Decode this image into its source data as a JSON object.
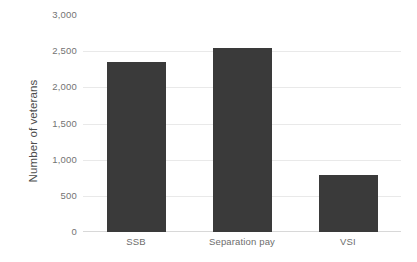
{
  "chart_data": {
    "type": "bar",
    "title": "",
    "subtitle": "",
    "xlabel": "",
    "ylabel": "Number of veterans",
    "categories": [
      "SSB",
      "Separation pay",
      "VSI"
    ],
    "values": [
      2350,
      2550,
      790
    ],
    "series": [
      {
        "name": "Number of veterans",
        "values": [
          2350,
          2550,
          790
        ]
      }
    ],
    "ylim": [
      0,
      3000
    ],
    "y_ticks": [
      0,
      500,
      1000,
      1500,
      2000,
      2500,
      3000
    ],
    "y_tick_labels": [
      "0",
      "500",
      "1,000",
      "1,500",
      "2,000",
      "2,500",
      "3,000"
    ],
    "grid": true,
    "legend": null,
    "legend_position": "none",
    "bar_color": "#3a3a3a",
    "grid_color": "#e9e9e9",
    "axis_text_color": "#737373",
    "axis_title_color": "#4d4d4d",
    "background_color": "#ffffff"
  }
}
